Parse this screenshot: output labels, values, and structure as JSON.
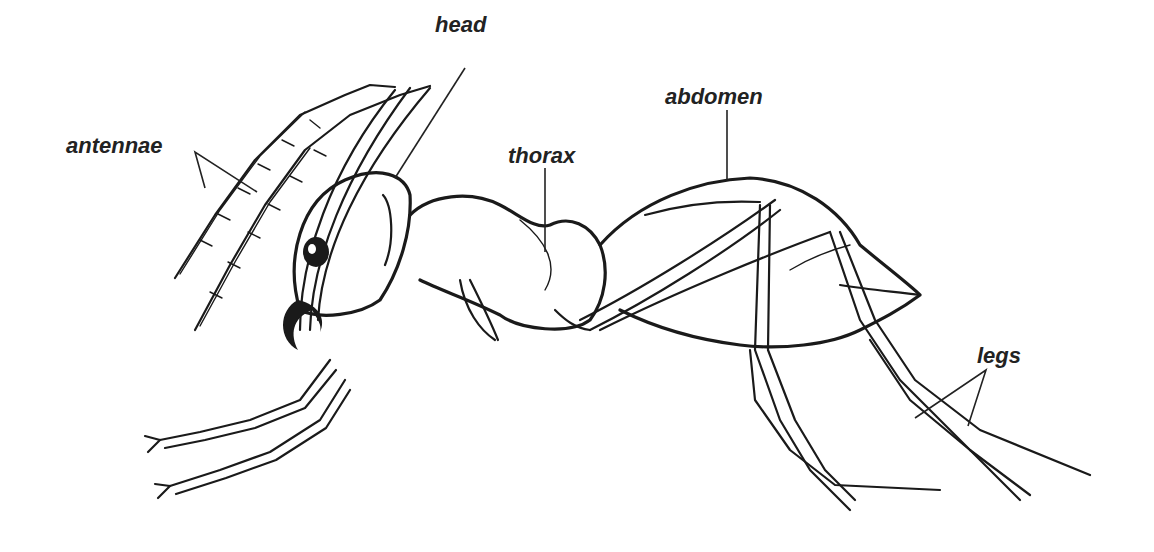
{
  "diagram": {
    "background": "#ffffff",
    "ink_color": "#1a1a1a",
    "labels": [
      {
        "id": "head",
        "text": "head",
        "x": 435,
        "y": 14
      },
      {
        "id": "antennae",
        "text": "antennae",
        "x": 66,
        "y": 135
      },
      {
        "id": "thorax",
        "text": "thorax",
        "x": 508,
        "y": 145
      },
      {
        "id": "abdomen",
        "text": "abdomen",
        "x": 665,
        "y": 86
      },
      {
        "id": "legs",
        "text": "legs",
        "x": 977,
        "y": 345
      }
    ]
  }
}
